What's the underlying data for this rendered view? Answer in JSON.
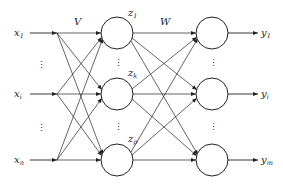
{
  "diagram": {
    "type": "neural-network",
    "colors": {
      "stroke": "#222222",
      "background": "#ffffff"
    },
    "weights": {
      "input_to_hidden": "V",
      "hidden_to_output": "W"
    },
    "input_layer": {
      "nodes": [
        {
          "base": "x",
          "sub": "1"
        },
        {
          "base": "x",
          "sub": "i"
        },
        {
          "base": "x",
          "sub": "n"
        }
      ],
      "ellipsis": "⋮"
    },
    "hidden_layer": {
      "nodes": [
        {
          "base": "z",
          "sub": "1"
        },
        {
          "base": "z",
          "sub": "k"
        },
        {
          "base": "z",
          "sub": "p"
        }
      ],
      "ellipsis": "⋮"
    },
    "output_layer": {
      "nodes": [
        {
          "base": "y",
          "sub": "1"
        },
        {
          "base": "y",
          "sub": "i"
        },
        {
          "base": "y",
          "sub": "m"
        }
      ],
      "ellipsis": "⋮"
    }
  }
}
